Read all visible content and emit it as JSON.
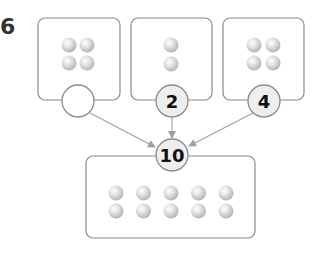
{
  "problem": {
    "number": "6"
  },
  "colors": {
    "box_stroke": "#8a8a8a",
    "circle_fill": "#eeeeee",
    "arrow": "#a0a0a0",
    "ball_light": "#f4f4f4",
    "ball_dark": "#b5b5b5"
  },
  "top_groups": [
    {
      "ball_count": 4,
      "layout": "2x2",
      "answer_circle": ""
    },
    {
      "ball_count": 2,
      "layout": "1x2",
      "answer_circle": "2"
    },
    {
      "ball_count": 4,
      "layout": "2x2",
      "answer_circle": "4"
    }
  ],
  "total_group": {
    "ball_count": 10,
    "layout": "5x2",
    "total_circle": "10"
  }
}
